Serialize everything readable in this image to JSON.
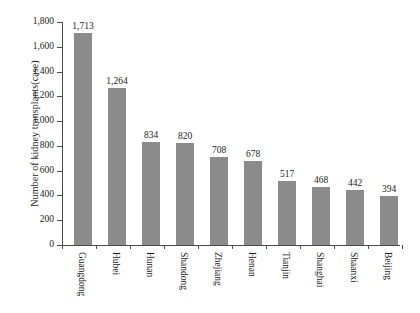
{
  "chart_data": {
    "type": "bar",
    "title": "",
    "xlabel": "",
    "ylabel": "Number of kidney transplants(case)",
    "categories": [
      "Guangdong",
      "Hubei",
      "Hunan",
      "Shandong",
      "Zhejiang",
      "Henan",
      "Tianjin",
      "Shanghai",
      "Shaanxi",
      "Beijing"
    ],
    "values": [
      1713,
      1264,
      834,
      820,
      708,
      678,
      517,
      468,
      442,
      394
    ],
    "value_labels": [
      "1,713",
      "1,264",
      "834",
      "820",
      "708",
      "678",
      "517",
      "468",
      "442",
      "394"
    ],
    "ylim": [
      0,
      1800
    ],
    "ytick_values": [
      0,
      200,
      400,
      600,
      800,
      1000,
      1200,
      1400,
      1600,
      1800
    ],
    "ytick_labels": [
      "0",
      "200",
      "400",
      "600",
      "800",
      "1,000",
      "1,200",
      "1,400",
      "1,600",
      "1,800"
    ],
    "grid": false,
    "legend": null,
    "bar_color": "#8b8b8b",
    "axis_color": "#4a4a4a",
    "background_color": "#ffffff"
  }
}
